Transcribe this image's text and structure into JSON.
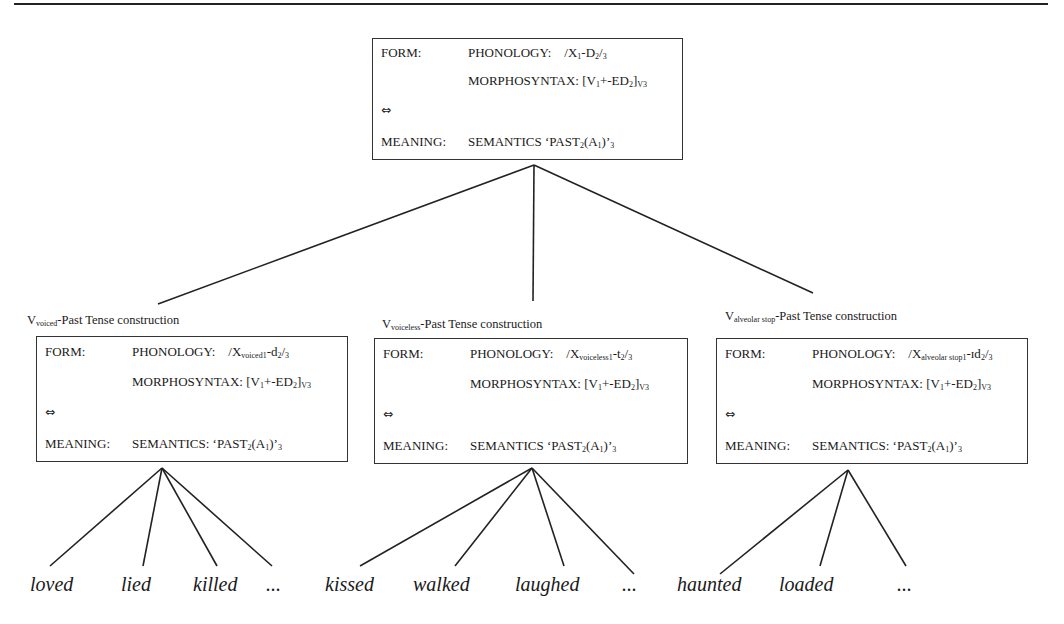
{
  "top_box": {
    "form_label": "FORM:",
    "phonology_label": "PHONOLOGY:",
    "phonology_value_prefix": "/X",
    "phonology_sub1": "1",
    "phonology_mid": "-D",
    "phonology_sub2": "2",
    "phonology_end": "/",
    "phonology_sub3": "3",
    "morphosyntax_label": "MORPHOSYNTAX:",
    "morph_prefix": "[V",
    "morph_sub1": "1",
    "morph_mid": "+-ED",
    "morph_sub2": "2",
    "morph_end": "]",
    "morph_sub3": "V3",
    "arrow": "⇔",
    "meaning_label": "MEANING:",
    "semantics_label": "SEMANTICS",
    "sem_prefix": "‘PAST",
    "sem_sub1": "2",
    "sem_mid": "(A",
    "sem_sub2": "1",
    "sem_end": ")’",
    "sem_sub3": "3"
  },
  "children": [
    {
      "title_v": "V",
      "title_sub": "voiced",
      "title_rest": "-Past Tense construction",
      "form_label": "FORM:",
      "phonology_label": "PHONOLOGY:",
      "ph_prefix": "/X",
      "ph_sub1": "voiced1",
      "ph_mid": "-d",
      "ph_sub2": "2",
      "ph_end": "/",
      "ph_sub3": "3",
      "morphosyntax_label": "MORPHOSYNTAX:",
      "morph_prefix": "[V",
      "morph_sub1": "1",
      "morph_mid": "+-ED",
      "morph_sub2": "2",
      "morph_end": "]",
      "morph_sub3": "V3",
      "arrow": "⇔",
      "meaning_label": "MEANING:",
      "semantics_label": "SEMANTICS:",
      "sem_prefix": "‘PAST",
      "sem_sub1": "2",
      "sem_mid": "(A",
      "sem_sub2": "1",
      "sem_end": ")’",
      "sem_sub3": "3",
      "words": [
        "loved",
        "lied",
        "killed",
        "..."
      ]
    },
    {
      "title_v": "V",
      "title_sub": "voiceless",
      "title_rest": "-Past Tense construction",
      "form_label": "FORM:",
      "phonology_label": "PHONOLOGY:",
      "ph_prefix": "/X",
      "ph_sub1": "voiceless1",
      "ph_mid": "-t",
      "ph_sub2": "2",
      "ph_end": "/",
      "ph_sub3": "3",
      "morphosyntax_label": "MORPHOSYNTAX:",
      "morph_prefix": "[V",
      "morph_sub1": "1",
      "morph_mid": "+-ED",
      "morph_sub2": "2",
      "morph_end": "]",
      "morph_sub3": "V3",
      "arrow": "⇔",
      "meaning_label": "MEANING:",
      "semantics_label": "SEMANTICS",
      "sem_prefix": "‘PAST",
      "sem_sub1": "2",
      "sem_mid": "(A",
      "sem_sub2": "1",
      "sem_end": ")’",
      "sem_sub3": "3",
      "words": [
        "kissed",
        "walked",
        "laughed",
        "..."
      ]
    },
    {
      "title_v": "V",
      "title_sub": "alveolar stop",
      "title_rest": "-Past Tense construction",
      "form_label": "FORM:",
      "phonology_label": "PHONOLOGY:",
      "ph_prefix": "/X",
      "ph_sub1": "alveolar stop1",
      "ph_mid": "-ɪd",
      "ph_sub2": "2",
      "ph_end": "/",
      "ph_sub3": "3",
      "morphosyntax_label": "MORPHOSYNTAX:",
      "morph_prefix": "[V",
      "morph_sub1": "1",
      "morph_mid": "+-ED",
      "morph_sub2": "2",
      "morph_end": "]",
      "morph_sub3": "V3",
      "arrow": "⇔",
      "meaning_label": "MEANING:",
      "semantics_label": "SEMANTICS:",
      "sem_prefix": "‘PAST",
      "sem_sub1": "2",
      "sem_mid": "(A",
      "sem_sub2": "1",
      "sem_end": ")’",
      "sem_sub3": "3",
      "words": [
        "haunted",
        "loaded",
        "..."
      ]
    }
  ]
}
